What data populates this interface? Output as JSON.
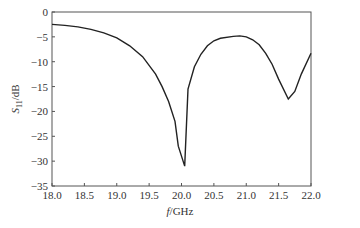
{
  "chart_data": {
    "type": "line",
    "title": "",
    "xlabel": "f/GHz",
    "ylabel": "S11/dB",
    "xlim": [
      18.0,
      22.0
    ],
    "ylim": [
      -35,
      0
    ],
    "xticks": [
      "18.0",
      "18.5",
      "19.0",
      "19.5",
      "20.0",
      "20.5",
      "21.0",
      "21.5",
      "22.0"
    ],
    "yticks": [
      "0",
      "-5",
      "-10",
      "-15",
      "-20",
      "-25",
      "-30",
      "-35"
    ],
    "grid": false,
    "legend": null,
    "series": [
      {
        "name": "S11",
        "color": "#222222",
        "x": [
          18.0,
          18.2,
          18.4,
          18.6,
          18.8,
          19.0,
          19.2,
          19.4,
          19.6,
          19.7,
          19.8,
          19.9,
          19.95,
          20.05,
          20.1,
          20.2,
          20.3,
          20.4,
          20.5,
          20.6,
          20.8,
          20.9,
          21.0,
          21.1,
          21.2,
          21.3,
          21.4,
          21.5,
          21.65,
          21.75,
          21.85,
          22.0
        ],
        "values": [
          -2.5,
          -2.7,
          -3.0,
          -3.5,
          -4.2,
          -5.2,
          -6.8,
          -9.0,
          -12.5,
          -15.0,
          -18.0,
          -22.0,
          -27.0,
          -31.0,
          -15.5,
          -11.0,
          -8.5,
          -6.8,
          -5.8,
          -5.3,
          -4.9,
          -4.8,
          -5.0,
          -5.6,
          -6.6,
          -8.3,
          -10.5,
          -13.5,
          -17.5,
          -16.0,
          -12.5,
          -8.3
        ]
      }
    ]
  }
}
